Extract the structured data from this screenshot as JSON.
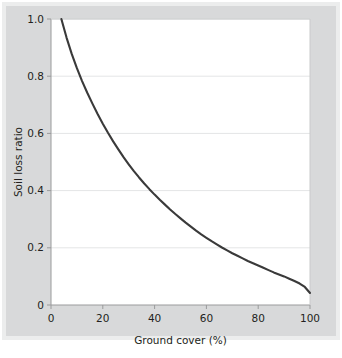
{
  "figure": {
    "background_color": "#d8d9da",
    "plot_background_color": "#ffffff",
    "curve_color": "#3a3a3a",
    "grid_color": "#e4e5e6",
    "axis_color": "#9a9b9c",
    "text_color": "#231f20"
  },
  "chart_data": {
    "type": "line",
    "title": "",
    "xlabel": "Ground cover (%)",
    "ylabel": "Soil loss ratio",
    "xlim": [
      0,
      100
    ],
    "ylim": [
      0,
      1.0
    ],
    "xticks": [
      "0",
      "20",
      "40",
      "60",
      "80",
      "100"
    ],
    "xtick_values": [
      0,
      20,
      40,
      60,
      80,
      100
    ],
    "yticks": [
      "0",
      "0.2",
      "0.4",
      "0.6",
      "0.8",
      "1.0"
    ],
    "ytick_values": [
      0,
      0.2,
      0.4,
      0.6,
      0.8,
      1.0
    ],
    "grid": "horizontal",
    "legend": "none",
    "series": [
      {
        "name": "Soil loss ratio vs ground cover",
        "x": [
          4,
          6,
          8,
          10,
          12,
          14,
          16,
          18,
          20,
          22,
          24,
          26,
          28,
          30,
          32,
          34,
          36,
          38,
          40,
          42,
          44,
          46,
          48,
          50,
          52,
          54,
          56,
          58,
          60,
          62,
          64,
          66,
          68,
          70,
          72,
          74,
          76,
          78,
          80,
          82,
          84,
          86,
          88,
          90,
          92,
          94,
          96,
          98,
          100
        ],
        "y": [
          1.0,
          0.935,
          0.878,
          0.828,
          0.783,
          0.742,
          0.704,
          0.668,
          0.634,
          0.602,
          0.572,
          0.544,
          0.517,
          0.492,
          0.468,
          0.446,
          0.425,
          0.405,
          0.386,
          0.368,
          0.351,
          0.334,
          0.318,
          0.303,
          0.288,
          0.274,
          0.26,
          0.247,
          0.235,
          0.223,
          0.212,
          0.201,
          0.191,
          0.181,
          0.172,
          0.163,
          0.154,
          0.146,
          0.138,
          0.13,
          0.122,
          0.114,
          0.107,
          0.1,
          0.092,
          0.084,
          0.075,
          0.063,
          0.042
        ]
      }
    ]
  }
}
